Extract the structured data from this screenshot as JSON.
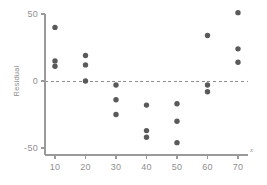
{
  "chart_data": {
    "type": "scatter",
    "title": "",
    "xlabel": "x",
    "ylabel": "Residual",
    "xlim": [
      5,
      75
    ],
    "ylim": [
      -58,
      55
    ],
    "grid": false,
    "legend": null,
    "reference_line": {
      "orientation": "horizontal",
      "value": 0,
      "style": "dashed"
    },
    "x_ticks": [
      10,
      20,
      30,
      40,
      50,
      60,
      70
    ],
    "x_tick_labels": [
      "10",
      "20",
      "30",
      "40",
      "50",
      "60",
      "70"
    ],
    "y_ticks": [
      -50,
      0,
      50
    ],
    "y_tick_labels": [
      "-50",
      "0",
      "50"
    ],
    "marker": {
      "shape": "circle",
      "color": "#5a5a5a",
      "size": 2.7
    },
    "points": [
      {
        "x": 10,
        "y": 40
      },
      {
        "x": 10,
        "y": 15
      },
      {
        "x": 10,
        "y": 11
      },
      {
        "x": 20,
        "y": 19
      },
      {
        "x": 20,
        "y": 12
      },
      {
        "x": 20,
        "y": 0
      },
      {
        "x": 30,
        "y": -3
      },
      {
        "x": 30,
        "y": -14
      },
      {
        "x": 30,
        "y": -25
      },
      {
        "x": 40,
        "y": -18
      },
      {
        "x": 40,
        "y": -37
      },
      {
        "x": 40,
        "y": -42
      },
      {
        "x": 50,
        "y": -17
      },
      {
        "x": 50,
        "y": -30
      },
      {
        "x": 50,
        "y": -46
      },
      {
        "x": 60,
        "y": 34
      },
      {
        "x": 60,
        "y": -3
      },
      {
        "x": 60,
        "y": -8
      },
      {
        "x": 70,
        "y": 51
      },
      {
        "x": 70,
        "y": 24
      },
      {
        "x": 70,
        "y": 14
      }
    ]
  },
  "colors": {
    "axis": "#9a9a9a",
    "text": "#8f8f8f",
    "marker": "#5a5a5a",
    "zero_line": "#8d8d8d",
    "background": "#ffffff"
  }
}
